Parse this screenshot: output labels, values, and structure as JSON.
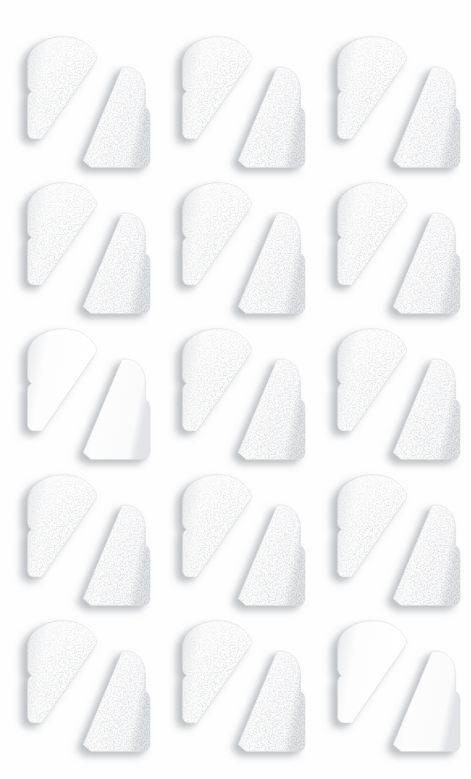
{
  "image": {
    "subject": "white-bread-slices-cut-diagonally",
    "description": "Grid of fifteen white sandwich bread slices, each cut in half on the diagonal, photographed from above on a plain white background",
    "background_color": "#fefefe",
    "bread_color": "#ffffff",
    "crust_shade_color": "#d8dade",
    "shadow_color": "#b6babe",
    "crumb_texture_color": "#c3c6ca",
    "width": 471,
    "height": 779
  },
  "grid": {
    "rows": 5,
    "columns": 3,
    "cell_count": 15,
    "column_pitch": 155,
    "row_pitch": 146,
    "origin_x": 20,
    "origin_y": 33
  },
  "cells": [
    {
      "row": 1,
      "col": 1,
      "texture": "speckled",
      "label": "bread-pair-r1c1"
    },
    {
      "row": 1,
      "col": 2,
      "texture": "speckled",
      "label": "bread-pair-r1c2"
    },
    {
      "row": 1,
      "col": 3,
      "texture": "speckled",
      "label": "bread-pair-r1c3"
    },
    {
      "row": 2,
      "col": 1,
      "texture": "speckled",
      "label": "bread-pair-r2c1"
    },
    {
      "row": 2,
      "col": 2,
      "texture": "speckled",
      "label": "bread-pair-r2c2"
    },
    {
      "row": 2,
      "col": 3,
      "texture": "speckled",
      "label": "bread-pair-r2c3"
    },
    {
      "row": 3,
      "col": 1,
      "texture": "smooth",
      "label": "bread-pair-r3c1"
    },
    {
      "row": 3,
      "col": 2,
      "texture": "speckled",
      "label": "bread-pair-r3c2"
    },
    {
      "row": 3,
      "col": 3,
      "texture": "speckled",
      "label": "bread-pair-r3c3"
    },
    {
      "row": 4,
      "col": 1,
      "texture": "speckled",
      "label": "bread-pair-r4c1"
    },
    {
      "row": 4,
      "col": 2,
      "texture": "speckled",
      "label": "bread-pair-r4c2"
    },
    {
      "row": 4,
      "col": 3,
      "texture": "speckled",
      "label": "bread-pair-r4c3"
    },
    {
      "row": 5,
      "col": 1,
      "texture": "speckled",
      "label": "bread-pair-r5c1"
    },
    {
      "row": 5,
      "col": 2,
      "texture": "speckled",
      "label": "bread-pair-r5c2"
    },
    {
      "row": 5,
      "col": 3,
      "texture": "smooth",
      "label": "bread-pair-r5c3"
    }
  ],
  "notes": {
    "speckled_count": 13,
    "smooth_count": 2,
    "pieces_per_cell": 2,
    "piece_names": [
      "left-half",
      "right-half"
    ]
  }
}
